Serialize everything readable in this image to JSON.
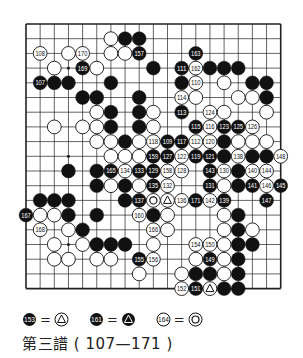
{
  "caption": "第三譜 ( 107—171 )",
  "board": {
    "size": 19,
    "hoshi": [
      [
        3,
        3
      ],
      [
        3,
        9
      ],
      [
        3,
        15
      ],
      [
        9,
        3
      ],
      [
        9,
        9
      ],
      [
        9,
        15
      ],
      [
        15,
        3
      ],
      [
        15,
        9
      ],
      [
        15,
        15
      ]
    ],
    "stones": [
      {
        "c": 6,
        "r": 1,
        "color": "white"
      },
      {
        "c": 7,
        "r": 1,
        "color": "black"
      },
      {
        "c": 8,
        "r": 1,
        "color": "black"
      },
      {
        "c": 1,
        "r": 2,
        "color": "white",
        "label": "108"
      },
      {
        "c": 3,
        "r": 2,
        "color": "white"
      },
      {
        "c": 4,
        "r": 2,
        "color": "white",
        "label": "170"
      },
      {
        "c": 6,
        "r": 2,
        "color": "white"
      },
      {
        "c": 7,
        "r": 2,
        "color": "white"
      },
      {
        "c": 8,
        "r": 2,
        "color": "black",
        "label": "157"
      },
      {
        "c": 12,
        "r": 2,
        "color": "black",
        "label": "163"
      },
      {
        "c": 2,
        "r": 3,
        "color": "white"
      },
      {
        "c": 4,
        "r": 3,
        "color": "black",
        "label": "169"
      },
      {
        "c": 5,
        "r": 3,
        "color": "white"
      },
      {
        "c": 9,
        "r": 3,
        "color": "black"
      },
      {
        "c": 11,
        "r": 3,
        "color": "black",
        "label": "111"
      },
      {
        "c": 12,
        "r": 3,
        "color": "white",
        "label": "162"
      },
      {
        "c": 13,
        "r": 3,
        "color": "black"
      },
      {
        "c": 14,
        "r": 3,
        "color": "black"
      },
      {
        "c": 15,
        "r": 3,
        "color": "black"
      },
      {
        "c": 1,
        "r": 4,
        "color": "black",
        "label": "107"
      },
      {
        "c": 2,
        "r": 4,
        "color": "black"
      },
      {
        "c": 3,
        "r": 4,
        "color": "black"
      },
      {
        "c": 6,
        "r": 4,
        "color": "black"
      },
      {
        "c": 11,
        "r": 4,
        "color": "black"
      },
      {
        "c": 12,
        "r": 4,
        "color": "white",
        "label": "110"
      },
      {
        "c": 14,
        "r": 4,
        "color": "white"
      },
      {
        "c": 16,
        "r": 4,
        "color": "black"
      },
      {
        "c": 17,
        "r": 4,
        "color": "black"
      },
      {
        "c": 4,
        "r": 5,
        "color": "black"
      },
      {
        "c": 5,
        "r": 5,
        "color": "black"
      },
      {
        "c": 8,
        "r": 5,
        "color": "black"
      },
      {
        "c": 11,
        "r": 5,
        "color": "white",
        "label": "114"
      },
      {
        "c": 12,
        "r": 5,
        "color": "white"
      },
      {
        "c": 15,
        "r": 5,
        "color": "white"
      },
      {
        "c": 16,
        "r": 5,
        "color": "white"
      },
      {
        "c": 17,
        "r": 5,
        "color": "black"
      },
      {
        "c": 5,
        "r": 6,
        "color": "white"
      },
      {
        "c": 6,
        "r": 6,
        "color": "black"
      },
      {
        "c": 8,
        "r": 6,
        "color": "black"
      },
      {
        "c": 9,
        "r": 6,
        "color": "white"
      },
      {
        "c": 11,
        "r": 6,
        "color": "black",
        "label": "113"
      },
      {
        "c": 13,
        "r": 6,
        "color": "white",
        "label": "124"
      },
      {
        "c": 14,
        "r": 6,
        "color": "white"
      },
      {
        "c": 17,
        "r": 6,
        "color": "white"
      },
      {
        "c": 2,
        "r": 7,
        "color": "white"
      },
      {
        "c": 4,
        "r": 7,
        "color": "white"
      },
      {
        "c": 5,
        "r": 7,
        "color": "white"
      },
      {
        "c": 6,
        "r": 7,
        "color": "black"
      },
      {
        "c": 8,
        "r": 7,
        "color": "black"
      },
      {
        "c": 9,
        "r": 7,
        "color": "white"
      },
      {
        "c": 12,
        "r": 7,
        "color": "black",
        "label": "115"
      },
      {
        "c": 13,
        "r": 7,
        "color": "white",
        "label": "116"
      },
      {
        "c": 14,
        "r": 7,
        "color": "black",
        "label": "123"
      },
      {
        "c": 15,
        "r": 7,
        "color": "black",
        "label": "125"
      },
      {
        "c": 16,
        "r": 7,
        "color": "white",
        "label": "126"
      },
      {
        "c": 5,
        "r": 8,
        "color": "white"
      },
      {
        "c": 6,
        "r": 8,
        "color": "white"
      },
      {
        "c": 7,
        "r": 8,
        "color": "black"
      },
      {
        "c": 8,
        "r": 8,
        "color": "white"
      },
      {
        "c": 9,
        "r": 8,
        "color": "white",
        "label": "118"
      },
      {
        "c": 10,
        "r": 8,
        "color": "black",
        "label": "109"
      },
      {
        "c": 11,
        "r": 8,
        "color": "black",
        "label": "117"
      },
      {
        "c": 12,
        "r": 8,
        "color": "white",
        "label": "112"
      },
      {
        "c": 13,
        "r": 8,
        "color": "white",
        "label": "120"
      },
      {
        "c": 14,
        "r": 8,
        "color": "black"
      },
      {
        "c": 15,
        "r": 8,
        "color": "white"
      },
      {
        "c": 16,
        "r": 8,
        "color": "white"
      },
      {
        "c": 17,
        "r": 8,
        "color": "white"
      },
      {
        "c": 6,
        "r": 9,
        "color": "white"
      },
      {
        "c": 7,
        "r": 9,
        "color": "white"
      },
      {
        "c": 8,
        "r": 9,
        "color": "white"
      },
      {
        "c": 9,
        "r": 9,
        "color": "black",
        "label": "159"
      },
      {
        "c": 10,
        "r": 9,
        "color": "black",
        "label": "127"
      },
      {
        "c": 11,
        "r": 9,
        "color": "white",
        "label": "122"
      },
      {
        "c": 12,
        "r": 9,
        "color": "black",
        "label": "119"
      },
      {
        "c": 13,
        "r": 9,
        "color": "black",
        "label": "121"
      },
      {
        "c": 14,
        "r": 9,
        "color": "black"
      },
      {
        "c": 15,
        "r": 9,
        "color": "white",
        "label": "138"
      },
      {
        "c": 16,
        "r": 9,
        "color": "black"
      },
      {
        "c": 17,
        "r": 9,
        "color": "black"
      },
      {
        "c": 18,
        "r": 9,
        "color": "white",
        "label": "148"
      },
      {
        "c": 3,
        "r": 10,
        "color": "black"
      },
      {
        "c": 5,
        "r": 10,
        "color": "black"
      },
      {
        "c": 6,
        "r": 10,
        "color": "black",
        "label": "165"
      },
      {
        "c": 7,
        "r": 10,
        "color": "white",
        "label": "134"
      },
      {
        "c": 8,
        "r": 10,
        "color": "black",
        "label": "133"
      },
      {
        "c": 9,
        "r": 10,
        "color": "black",
        "label": "129"
      },
      {
        "c": 10,
        "r": 10,
        "color": "white",
        "label": "158"
      },
      {
        "c": 11,
        "r": 10,
        "color": "white",
        "label": "128"
      },
      {
        "c": 13,
        "r": 10,
        "color": "black",
        "label": "143"
      },
      {
        "c": 14,
        "r": 10,
        "color": "white",
        "label": "130"
      },
      {
        "c": 15,
        "r": 10,
        "color": "black"
      },
      {
        "c": 16,
        "r": 10,
        "color": "white",
        "label": "140"
      },
      {
        "c": 17,
        "r": 10,
        "color": "white",
        "label": "144"
      },
      {
        "c": 5,
        "r": 11,
        "color": "black"
      },
      {
        "c": 6,
        "r": 11,
        "color": "white"
      },
      {
        "c": 7,
        "r": 11,
        "color": "black"
      },
      {
        "c": 8,
        "r": 11,
        "color": "white"
      },
      {
        "c": 9,
        "r": 11,
        "color": "black",
        "label": "135"
      },
      {
        "c": 10,
        "r": 11,
        "color": "white",
        "label": "132"
      },
      {
        "c": 13,
        "r": 11,
        "color": "black",
        "label": "131"
      },
      {
        "c": 14,
        "r": 11,
        "color": "white"
      },
      {
        "c": 15,
        "r": 11,
        "color": "black"
      },
      {
        "c": 16,
        "r": 11,
        "color": "black",
        "label": "141"
      },
      {
        "c": 17,
        "r": 11,
        "color": "white",
        "label": "146"
      },
      {
        "c": 18,
        "r": 11,
        "color": "black",
        "label": "145"
      },
      {
        "c": 1,
        "r": 12,
        "color": "black"
      },
      {
        "c": 2,
        "r": 12,
        "color": "black"
      },
      {
        "c": 3,
        "r": 12,
        "color": "black"
      },
      {
        "c": 7,
        "r": 12,
        "color": "black"
      },
      {
        "c": 8,
        "r": 12,
        "color": "black",
        "label": "137"
      },
      {
        "c": 9,
        "r": 12,
        "color": "white",
        "mark": "double-circle"
      },
      {
        "c": 10,
        "r": 12,
        "color": "white",
        "mark": "triangle"
      },
      {
        "c": 11,
        "r": 12,
        "color": "white",
        "label": "136"
      },
      {
        "c": 12,
        "r": 12,
        "color": "black",
        "label": "171"
      },
      {
        "c": 13,
        "r": 12,
        "color": "white",
        "label": "142"
      },
      {
        "c": 14,
        "r": 12,
        "color": "black",
        "label": "139"
      },
      {
        "c": 17,
        "r": 12,
        "color": "black",
        "label": "147"
      },
      {
        "c": 0,
        "r": 13,
        "color": "black",
        "label": "167"
      },
      {
        "c": 1,
        "r": 13,
        "color": "white"
      },
      {
        "c": 2,
        "r": 13,
        "color": "white"
      },
      {
        "c": 3,
        "r": 13,
        "color": "black"
      },
      {
        "c": 5,
        "r": 13,
        "color": "black"
      },
      {
        "c": 8,
        "r": 13,
        "color": "white",
        "label": "160"
      },
      {
        "c": 9,
        "r": 13,
        "color": "black"
      },
      {
        "c": 10,
        "r": 13,
        "color": "white"
      },
      {
        "c": 14,
        "r": 13,
        "color": "white"
      },
      {
        "c": 15,
        "r": 13,
        "color": "black"
      },
      {
        "c": 1,
        "r": 14,
        "color": "white",
        "label": "168"
      },
      {
        "c": 3,
        "r": 14,
        "color": "white"
      },
      {
        "c": 4,
        "r": 14,
        "color": "black"
      },
      {
        "c": 9,
        "r": 14,
        "color": "white",
        "label": "166"
      },
      {
        "c": 10,
        "r": 14,
        "color": "white"
      },
      {
        "c": 14,
        "r": 14,
        "color": "white"
      },
      {
        "c": 15,
        "r": 14,
        "color": "black"
      },
      {
        "c": 16,
        "r": 14,
        "color": "white"
      },
      {
        "c": 2,
        "r": 15,
        "color": "white"
      },
      {
        "c": 4,
        "r": 15,
        "color": "white"
      },
      {
        "c": 5,
        "r": 15,
        "color": "black"
      },
      {
        "c": 6,
        "r": 15,
        "color": "black"
      },
      {
        "c": 7,
        "r": 15,
        "color": "black"
      },
      {
        "c": 9,
        "r": 15,
        "color": "white"
      },
      {
        "c": 12,
        "r": 15,
        "color": "white",
        "label": "154"
      },
      {
        "c": 13,
        "r": 15,
        "color": "white",
        "label": "150"
      },
      {
        "c": 14,
        "r": 15,
        "color": "white"
      },
      {
        "c": 15,
        "r": 15,
        "color": "black"
      },
      {
        "c": 16,
        "r": 15,
        "color": "black"
      },
      {
        "c": 2,
        "r": 16,
        "color": "white"
      },
      {
        "c": 3,
        "r": 16,
        "color": "white"
      },
      {
        "c": 5,
        "r": 16,
        "color": "white"
      },
      {
        "c": 6,
        "r": 16,
        "color": "white"
      },
      {
        "c": 8,
        "r": 16,
        "color": "black",
        "label": "155"
      },
      {
        "c": 9,
        "r": 16,
        "color": "white",
        "label": "156"
      },
      {
        "c": 12,
        "r": 16,
        "color": "white"
      },
      {
        "c": 13,
        "r": 16,
        "color": "black",
        "label": "149"
      },
      {
        "c": 14,
        "r": 16,
        "color": "white"
      },
      {
        "c": 15,
        "r": 16,
        "color": "black"
      },
      {
        "c": 8,
        "r": 17,
        "color": "white"
      },
      {
        "c": 11,
        "r": 17,
        "color": "white"
      },
      {
        "c": 12,
        "r": 17,
        "color": "black"
      },
      {
        "c": 13,
        "r": 17,
        "color": "black"
      },
      {
        "c": 14,
        "r": 17,
        "color": "white"
      },
      {
        "c": 15,
        "r": 17,
        "color": "black"
      },
      {
        "c": 11,
        "r": 18,
        "color": "white",
        "label": "152"
      },
      {
        "c": 12,
        "r": 18,
        "color": "black",
        "label": "151"
      },
      {
        "c": 13,
        "r": 18,
        "color": "white",
        "mark": "triangle"
      },
      {
        "c": 14,
        "r": 18,
        "color": "black"
      },
      {
        "c": 15,
        "r": 18,
        "color": "black"
      }
    ]
  },
  "legend": [
    {
      "move": "153",
      "move_color": "black",
      "equals": "=",
      "target_color": "white",
      "target_mark": "triangle"
    },
    {
      "move": "161",
      "move_color": "black",
      "equals": "=",
      "target_color": "black",
      "target_mark": "triangle"
    },
    {
      "move": "164",
      "move_color": "white",
      "equals": "=",
      "target_color": "white",
      "target_mark": "double-circle"
    }
  ]
}
